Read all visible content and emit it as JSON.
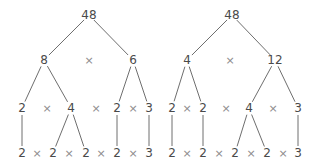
{
  "diagram": {
    "type": "factor-trees",
    "times_symbol": "×",
    "trees": [
      {
        "name": "factor-tree-left",
        "rows": [
          [
            "48"
          ],
          [
            "8",
            "×",
            "6"
          ],
          [
            "2",
            "×",
            "4",
            "×",
            "2",
            "×",
            "3"
          ],
          [
            "2",
            "×",
            "2",
            "×",
            "2",
            "×",
            "2",
            "×",
            "3"
          ]
        ],
        "edges": [
          [
            "48",
            "8"
          ],
          [
            "48",
            "6"
          ],
          [
            "8",
            "2"
          ],
          [
            "8",
            "4"
          ],
          [
            "6",
            "2"
          ],
          [
            "6",
            "3"
          ],
          [
            "2",
            "2"
          ],
          [
            "4",
            "2"
          ],
          [
            "4",
            "2"
          ],
          [
            "2",
            "2"
          ],
          [
            "3",
            "3"
          ]
        ]
      },
      {
        "name": "factor-tree-right",
        "rows": [
          [
            "48"
          ],
          [
            "4",
            "×",
            "12"
          ],
          [
            "2",
            "×",
            "2",
            "×",
            "4",
            "×",
            "3"
          ],
          [
            "2",
            "×",
            "2",
            "×",
            "2",
            "×",
            "2",
            "×",
            "3"
          ]
        ],
        "edges": [
          [
            "48",
            "4"
          ],
          [
            "48",
            "12"
          ],
          [
            "4",
            "2"
          ],
          [
            "4",
            "2"
          ],
          [
            "12",
            "4"
          ],
          [
            "12",
            "3"
          ],
          [
            "2",
            "2"
          ],
          [
            "2",
            "2"
          ],
          [
            "4",
            "2"
          ],
          [
            "4",
            "2"
          ],
          [
            "3",
            "3"
          ]
        ]
      }
    ]
  }
}
